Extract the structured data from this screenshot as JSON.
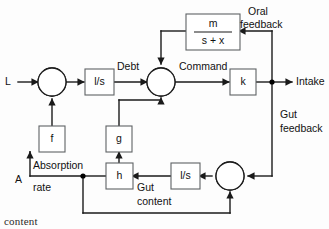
{
  "diagram": {
    "type": "control-block-diagram",
    "background_color": "#fdfdfd",
    "line_color": "#1a1a1a",
    "block_stroke_color": "#5f6365",
    "fill_color": "#000000",
    "blocks": [
      {
        "id": "integrator-1",
        "label": "l/s",
        "kind": "transfer-block"
      },
      {
        "id": "gain-k",
        "label": "k",
        "kind": "transfer-block"
      },
      {
        "id": "gain-f",
        "label": "f",
        "kind": "transfer-block"
      },
      {
        "id": "gain-g",
        "label": "g",
        "kind": "transfer-block"
      },
      {
        "id": "gain-h",
        "label": "h",
        "kind": "transfer-block"
      },
      {
        "id": "integrator-2",
        "label": "l/s",
        "kind": "transfer-block"
      },
      {
        "id": "oral-lag",
        "numerator": "m",
        "denominator": "s + x",
        "kind": "fraction-block"
      }
    ],
    "summing_junctions": [
      {
        "id": "sum-1",
        "filled_quadrant": "bottom"
      },
      {
        "id": "sum-2",
        "filled_quadrant": "bottom"
      },
      {
        "id": "sum-3",
        "filled_quadrant": "bottom"
      }
    ],
    "signals": {
      "input_l": "L",
      "input_a": "A",
      "debt": "Debt",
      "command": "Command",
      "intake": "Intake",
      "oral_feedback_line1": "Oral",
      "oral_feedback_line2": "feedback",
      "gut_feedback_line1": "Gut",
      "gut_feedback_line2": "feedback",
      "absorption_line1": "Absorption",
      "absorption_line2": "rate",
      "gut_content_line1": "Gut",
      "gut_content_line2": "content"
    },
    "caption_fragment": "content"
  }
}
